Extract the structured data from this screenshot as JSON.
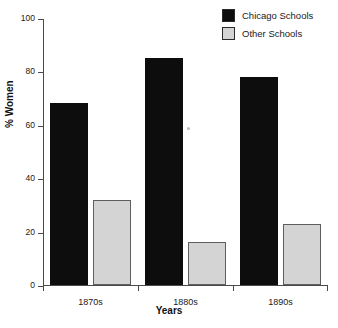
{
  "chart_data": {
    "type": "bar",
    "title": "",
    "xlabel": "Years",
    "ylabel": "% Women",
    "categories": [
      "1870s",
      "1880s",
      "1890s"
    ],
    "series": [
      {
        "name": "Chicago Schools",
        "color": "#0d0d0d",
        "values": [
          68,
          85,
          78
        ]
      },
      {
        "name": "Other Schools",
        "color": "#d4d4d4",
        "values": [
          32,
          16,
          23
        ]
      }
    ],
    "ylim": [
      0,
      100
    ],
    "yticks": [
      0,
      20,
      40,
      60,
      80,
      100
    ],
    "ytick_labels": [
      "0",
      "20",
      "40",
      "60",
      "80",
      "100"
    ],
    "grid": false,
    "legend_position": "top-right"
  },
  "axes": {
    "y_title": "% Women",
    "x_title": "Years"
  },
  "legend": {
    "items": [
      {
        "label": "Chicago Schools",
        "color": "#0d0d0d"
      },
      {
        "label": "Other Schools",
        "color": "#d4d4d4"
      }
    ]
  }
}
